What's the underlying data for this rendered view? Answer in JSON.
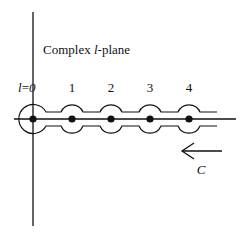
{
  "diagram": {
    "title_prefix": "Complex ",
    "title_var": "l",
    "title_suffix": "-plane",
    "origin_label_var": "l",
    "origin_label_eq": "=",
    "origin_label_val": "0",
    "pole_labels": [
      "1",
      "2",
      "3",
      "4"
    ],
    "contour_label": "C",
    "poles": [
      0,
      1,
      2,
      3,
      4
    ],
    "colors": {
      "line": "#111111",
      "background": "#ffffff"
    }
  }
}
